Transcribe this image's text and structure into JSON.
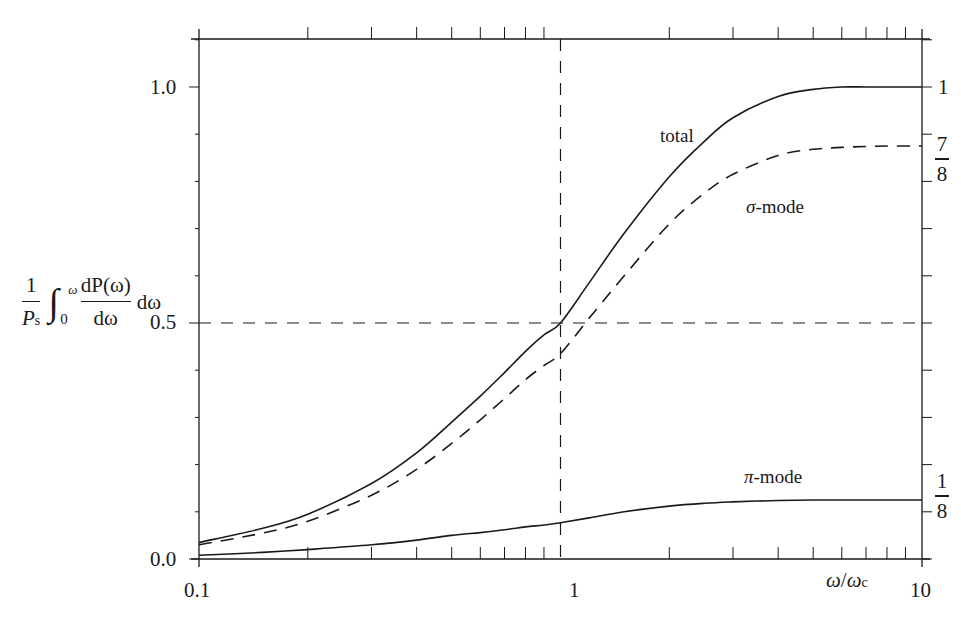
{
  "chart_data": {
    "type": "line",
    "title": "",
    "xlabel": "ω/ω_c",
    "ylabel": "(1/P_s) ∫_0^ω (dP(ω)/dω) dω",
    "xscale": "log",
    "xlim": [
      0.1,
      10
    ],
    "ylim": [
      0.0,
      1.1
    ],
    "x_ticks": [
      "0.1",
      "1",
      "10"
    ],
    "y_ticks": [
      "0.0",
      "0.5",
      "1.0"
    ],
    "right_ticks": [
      {
        "label": "1",
        "value": 1.0
      },
      {
        "label": "7/8",
        "value": 0.875
      },
      {
        "label": "1/8",
        "value": 0.125
      }
    ],
    "grid": false,
    "reference_lines": [
      {
        "orientation": "vertical",
        "x": 1,
        "style": "dashed"
      },
      {
        "orientation": "horizontal",
        "y": 0.5,
        "style": "dashed"
      }
    ],
    "x": [
      0.1,
      0.15,
      0.2,
      0.3,
      0.4,
      0.5,
      0.6,
      0.7,
      0.8,
      0.9,
      1.0,
      1.2,
      1.5,
      2.0,
      2.5,
      3.0,
      4.0,
      5.0,
      6.0,
      7.0,
      8.0,
      10.0
    ],
    "series": [
      {
        "name": "total",
        "style": "solid",
        "values": [
          0.035,
          0.065,
          0.095,
          0.16,
          0.225,
          0.29,
          0.345,
          0.395,
          0.44,
          0.475,
          0.5,
          0.585,
          0.69,
          0.81,
          0.885,
          0.935,
          0.98,
          0.995,
          1.0,
          1.0,
          1.0,
          1.0
        ]
      },
      {
        "name": "σ-mode",
        "style": "dashed",
        "values": [
          0.03,
          0.055,
          0.08,
          0.135,
          0.19,
          0.245,
          0.295,
          0.34,
          0.38,
          0.41,
          0.435,
          0.51,
          0.6,
          0.71,
          0.775,
          0.815,
          0.855,
          0.868,
          0.872,
          0.874,
          0.875,
          0.875
        ]
      },
      {
        "name": "π-mode",
        "style": "solid",
        "values": [
          0.008,
          0.014,
          0.02,
          0.03,
          0.04,
          0.05,
          0.056,
          0.062,
          0.068,
          0.072,
          0.077,
          0.087,
          0.1,
          0.112,
          0.118,
          0.121,
          0.124,
          0.125,
          0.125,
          0.125,
          0.125,
          0.125
        ]
      }
    ],
    "annotations": [
      {
        "text": "total",
        "x": 2.2,
        "y": 0.86
      },
      {
        "text": "σ-mode",
        "x": 3.3,
        "y": 0.65
      },
      {
        "text": "π-mode",
        "x": 3.0,
        "y": 0.155
      }
    ]
  },
  "labels": {
    "y_ticks": {
      "t0": "0.0",
      "t05": "0.5",
      "t1": "1.0"
    },
    "x_ticks": {
      "t01": "0.1",
      "t1": "1",
      "t10": "10"
    },
    "x_axis": {
      "omega": "ω",
      "slash": "/",
      "omega_c": "ω",
      "sub_c": "c"
    },
    "right": {
      "one": "1",
      "seven": "7",
      "eight_a": "8",
      "one_b": "1",
      "eight_b": "8"
    },
    "curves": {
      "total": "total",
      "sigma_sym": "σ",
      "sigma_rest": "-mode",
      "pi_sym": "π",
      "pi_rest": "-mode"
    },
    "ylabel": {
      "num": "1",
      "den_P": "P",
      "den_s": "s",
      "int": "∫",
      "upper": "ω",
      "lower": "0",
      "dnum": "dP(ω)",
      "dden": "dω",
      "tail": "dω"
    }
  }
}
